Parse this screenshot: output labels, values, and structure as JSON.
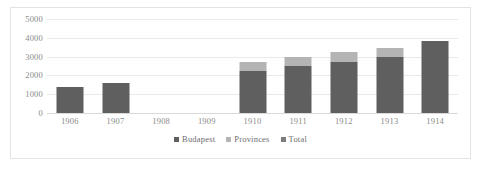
{
  "chart_data": {
    "type": "bar",
    "subtype": "stacked-column",
    "title": "",
    "subtitle": "",
    "xlabel": "",
    "ylabel": "",
    "categories": [
      "1906",
      "1907",
      "1908",
      "1909",
      "1910",
      "1911",
      "1912",
      "1913",
      "1914"
    ],
    "series": [
      {
        "name": "Budapest",
        "color": "#5f5f5f",
        "values": [
          1370,
          1600,
          null,
          null,
          2250,
          2520,
          2700,
          3000,
          3830
        ]
      },
      {
        "name": "Provinces",
        "color": "#b4b4b4",
        "values": [
          null,
          null,
          null,
          null,
          450,
          480,
          520,
          480,
          null
        ]
      },
      {
        "name": "Total",
        "color": "#7d7d7d",
        "values": [
          null,
          null,
          null,
          null,
          null,
          null,
          null,
          null,
          null
        ]
      }
    ],
    "ylim": [
      0,
      5000
    ],
    "yticks": [
      0,
      1000,
      2000,
      3000,
      4000,
      5000
    ],
    "ytick_labels": [
      "0",
      "1000",
      "2000",
      "3000",
      "4000",
      "5000"
    ],
    "grid": true,
    "grid_axis": "y",
    "legend": {
      "position": "bottom",
      "entries": [
        {
          "label": "Budapest",
          "color": "#5f5f5f"
        },
        {
          "label": "Provinces",
          "color": "#b4b4b4"
        },
        {
          "label": "Total",
          "color": "#7d7d7d"
        }
      ]
    },
    "plot_background": "#ffffff",
    "border_color": "#e3e3e3",
    "gridline_color": "#e9e9e9",
    "tick_label_color": "#8a8a8a"
  }
}
